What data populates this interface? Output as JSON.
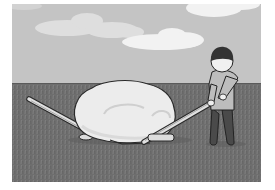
{
  "illustration": {
    "description": "Cartoon of a person using two long levers to pry up a large pale boulder on a grassy field under a cloudy sky",
    "style": "grayscale flat cartoon",
    "elements": {
      "sky": "sky-background",
      "clouds": [
        "cloud-left",
        "cloud-center",
        "cloud-top-right"
      ],
      "ground": "grass-field",
      "boulder": "large-boulder",
      "levers": [
        "left-lever",
        "right-lever"
      ],
      "fulcrums": [
        "left-fulcrum-stone",
        "right-fulcrum-stone"
      ],
      "person": "person-with-dark-hair"
    },
    "colors": {
      "sky": "#c4c4c4",
      "cloud": "#e6e6e6",
      "cloud_bright": "#f2f2f2",
      "ground": "#6e6e6e",
      "ground_texture": "#808080",
      "boulder": "#ececec",
      "boulder_shade": "#d8d8d8",
      "outline": "#2a2a2a",
      "lever": "#e0e0e0",
      "hair": "#333333",
      "face": "#f0f0f0",
      "shirt": "#bdbdbd",
      "pants": "#4a4a4a"
    }
  }
}
